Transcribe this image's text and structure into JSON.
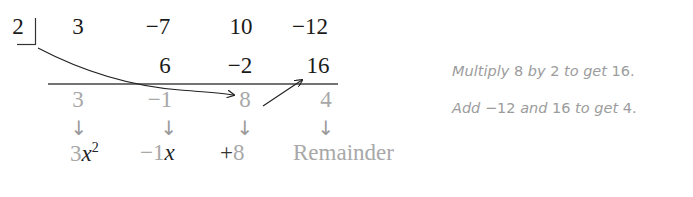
{
  "divisor": "2",
  "dividend_row": [
    "3",
    "−7",
    "10",
    "−12"
  ],
  "product_row": [
    "",
    "6",
    "−2",
    "16"
  ],
  "result_row": [
    "3",
    "−1",
    "8",
    "4"
  ],
  "down_arrows": [
    "↓",
    "↓",
    "↓",
    "↓"
  ],
  "quotient_terms": {
    "t1": {
      "coef": "3",
      "var": "x",
      "exp": "2"
    },
    "t2": {
      "coef": "−1",
      "var": "x"
    },
    "t3": {
      "sign": "+",
      "value": "8"
    },
    "t4": {
      "label": "Remainder"
    }
  },
  "notes": [
    {
      "w1": "Multiply",
      "n1": "8",
      "w2": "by",
      "n2": "2",
      "w3": "to get",
      "n3": "16."
    },
    {
      "w1": "Add",
      "n1": "−12",
      "w2": "and",
      "n2": "16",
      "w3": "to get",
      "n3": "4."
    }
  ],
  "colors": {
    "primary_text": "#1a1a1a",
    "faded_text": "#a8a8a8",
    "note_text": "#9c9c9c"
  }
}
